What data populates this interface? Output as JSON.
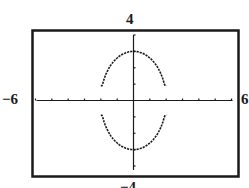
{
  "window": {
    "xmin": -6,
    "xmax": 6,
    "ymin": -4,
    "ymax": 4,
    "labels": {
      "top": "4",
      "bottom": "−4",
      "left": "−6",
      "right": "6"
    }
  },
  "colors": {
    "ink": "#1a1a1a",
    "background": "#ffffff"
  },
  "chart_data": {
    "type": "line",
    "title": "",
    "xlabel": "",
    "ylabel": "",
    "xlim": [
      -6,
      6
    ],
    "ylim": [
      -4,
      4
    ],
    "xticks": [
      -6,
      -5,
      -4,
      -3,
      -2,
      -1,
      0,
      1,
      2,
      3,
      4,
      5,
      6
    ],
    "yticks": [
      -4,
      -3,
      -2,
      -1,
      0,
      1,
      2,
      3,
      4
    ],
    "grid": false,
    "legend": null,
    "series": [
      {
        "name": "upper arc",
        "equation": "y = 3*sqrt(1 - x^2/4)",
        "x_range": [
          -2,
          2
        ],
        "points": [
          [
            -2,
            0.9
          ],
          [
            -1.5,
            1.98
          ],
          [
            -1,
            2.6
          ],
          [
            -0.5,
            2.9
          ],
          [
            0,
            3
          ],
          [
            0.5,
            2.9
          ],
          [
            1,
            2.6
          ],
          [
            1.5,
            1.98
          ],
          [
            2,
            0.9
          ]
        ]
      },
      {
        "name": "lower arc",
        "equation": "y = -3*sqrt(1 - x^2/4)",
        "x_range": [
          -2,
          2
        ],
        "points": [
          [
            -2,
            -0.9
          ],
          [
            -1.5,
            -1.98
          ],
          [
            -1,
            -2.6
          ],
          [
            -0.5,
            -2.9
          ],
          [
            0,
            -3
          ],
          [
            0.5,
            -2.9
          ],
          [
            1,
            -2.6
          ],
          [
            1.5,
            -1.98
          ],
          [
            2,
            -0.9
          ]
        ]
      }
    ],
    "annotations": [
      "Ellipse x^2/4 + y^2/9 = 1 plotted on graphing-calculator window [-6,6] x [-4,4]"
    ]
  }
}
